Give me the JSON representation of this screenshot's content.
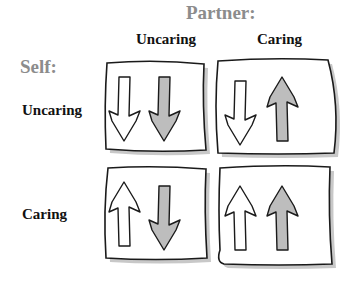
{
  "partner_heading": "Partner:",
  "self_heading": "Self:",
  "columns": [
    {
      "label": "Uncaring"
    },
    {
      "label": "Caring"
    }
  ],
  "rows": [
    {
      "label": "Uncaring"
    },
    {
      "label": "Caring"
    }
  ],
  "cells": [
    {
      "row": "Uncaring",
      "col": "Uncaring",
      "self_arrow": "down",
      "partner_arrow": "down"
    },
    {
      "row": "Uncaring",
      "col": "Caring",
      "self_arrow": "down",
      "partner_arrow": "up"
    },
    {
      "row": "Caring",
      "col": "Uncaring",
      "self_arrow": "up",
      "partner_arrow": "down"
    },
    {
      "row": "Caring",
      "col": "Caring",
      "self_arrow": "up",
      "partner_arrow": "up"
    }
  ],
  "colors": {
    "heading_gray": "#8c8c8c",
    "self_arrow_fill": "#ffffff",
    "partner_arrow_fill": "#bdbdbd",
    "outline": "#1a1a1a",
    "shadow": "#9a9a9a"
  }
}
